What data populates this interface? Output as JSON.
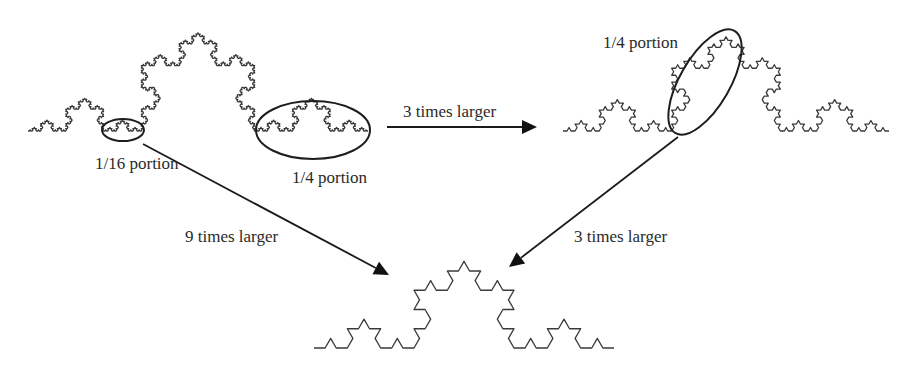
{
  "diagram": {
    "colors": {
      "curve": "#3a3a3a",
      "ellipse": "#1e1e1e",
      "arrow": "#111111",
      "text": "#2a2a2a",
      "background": "#ffffff"
    },
    "curves": [
      {
        "id": "koch-original",
        "x1": 28,
        "y1": 131,
        "x2": 368,
        "y2": 131,
        "iterations": 4
      },
      {
        "id": "koch-3x",
        "x1": 563,
        "y1": 131,
        "x2": 889,
        "y2": 131,
        "iterations": 3
      },
      {
        "id": "koch-9x",
        "x1": 314,
        "y1": 348,
        "x2": 614,
        "y2": 348,
        "iterations": 2
      }
    ],
    "ellipses": [
      {
        "id": "ellipse-1-16-portion",
        "cx": 123,
        "cy": 130,
        "rx": 21,
        "ry": 11,
        "rotate": 0
      },
      {
        "id": "ellipse-1-4-portion-left",
        "cx": 313,
        "cy": 130,
        "rx": 57,
        "ry": 29,
        "rotate": 0
      },
      {
        "id": "ellipse-1-4-portion-right",
        "cx": 705,
        "cy": 82,
        "rx": 59,
        "ry": 25,
        "rotate": -60
      }
    ],
    "arrows": [
      {
        "id": "arrow-3x-horizontal",
        "x1": 387,
        "y1": 127,
        "x2": 537,
        "y2": 127
      },
      {
        "id": "arrow-9x",
        "x1": 143,
        "y1": 144,
        "x2": 389,
        "y2": 275
      },
      {
        "id": "arrow-3x-diagonal",
        "x1": 678,
        "y1": 137,
        "x2": 509,
        "y2": 267
      }
    ],
    "labels": {
      "portion_1_16": "1/16 portion",
      "portion_1_4_left": "1/4 portion",
      "portion_1_4_right": "1/4 portion",
      "three_times_top": "3 times larger",
      "nine_times": "9 times larger",
      "three_times_bottom": "3 times larger"
    }
  }
}
